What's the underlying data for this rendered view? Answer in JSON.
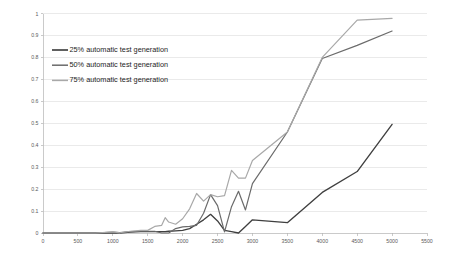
{
  "chart_data": {
    "type": "line",
    "title": "",
    "subtitle": "",
    "xlabel": "",
    "ylabel": "",
    "xlim": [
      0,
      5500
    ],
    "ylim": [
      0,
      1
    ],
    "grid": true,
    "grid_axis": "y",
    "legend_position": "upper-left-inside",
    "x_ticks": [
      0,
      500,
      1000,
      1500,
      2000,
      2500,
      3000,
      3500,
      4000,
      4500,
      5000,
      5500
    ],
    "x_tick_labels": [
      "0",
      "500",
      "1000",
      "1500",
      "2000",
      "2500",
      "3000",
      "3500",
      "4000",
      "4500",
      "5000",
      "5500"
    ],
    "y_ticks": [
      0,
      0.1,
      0.2,
      0.3,
      0.4,
      0.5,
      0.6,
      0.7,
      0.8,
      0.9,
      1
    ],
    "y_tick_labels": [
      "0",
      "0.1",
      "0.2",
      "0.3",
      "0.4",
      "0.5",
      "0.6",
      "0.7",
      "0.8",
      "0.9",
      "1"
    ],
    "x": [
      0,
      250,
      500,
      750,
      1000,
      1100,
      1250,
      1400,
      1500,
      1600,
      1700,
      1750,
      1800,
      1900,
      2000,
      2100,
      2200,
      2300,
      2400,
      2500,
      2600,
      2700,
      2800,
      2900,
      3000,
      3500,
      4000,
      4500,
      5000
    ],
    "series": [
      {
        "name": "25% automatic test generation",
        "color": "#3f3f3f",
        "width": 1.35,
        "values": [
          0,
          0,
          0,
          0,
          0,
          0,
          0.004,
          0.006,
          0.006,
          0.006,
          0.006,
          0.006,
          0.008,
          0.01,
          0.012,
          0.02,
          0.04,
          0.06,
          0.085,
          0.055,
          0.012,
          0.006,
          0.0,
          0.03,
          0.06,
          0.047,
          0.185,
          0.28,
          0.495
        ]
      },
      {
        "name": "50% automatic test generation",
        "color": "#6b6b6b",
        "width": 1.2,
        "values": [
          0,
          0,
          0,
          0,
          0.004,
          0.002,
          0.006,
          0.008,
          0.008,
          0.008,
          0.0,
          0.0,
          0.0,
          0.02,
          0.028,
          0.03,
          0.035,
          0.09,
          0.175,
          0.125,
          0.005,
          0.12,
          0.19,
          0.105,
          0.225,
          0.46,
          0.795,
          0.855,
          0.92
        ]
      },
      {
        "name": "75% automatic test generation",
        "color": "#a8a8a8",
        "width": 1.2,
        "values": [
          0,
          0,
          0,
          0,
          0.005,
          0.001,
          0.008,
          0.012,
          0.012,
          0.03,
          0.035,
          0.07,
          0.05,
          0.04,
          0.065,
          0.11,
          0.18,
          0.145,
          0.175,
          0.165,
          0.17,
          0.285,
          0.25,
          0.25,
          0.33,
          0.46,
          0.8,
          0.97,
          0.978
        ]
      }
    ]
  },
  "legend": {
    "entries": [
      {
        "label": "25% automatic test generation"
      },
      {
        "label": "50% automatic test generation"
      },
      {
        "label": "75% automatic test generation"
      }
    ]
  }
}
